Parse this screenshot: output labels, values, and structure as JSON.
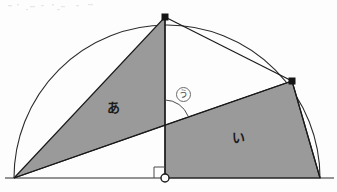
{
  "figure": {
    "background_color": "#fdfdfd",
    "line_color": "#1a1a1a",
    "arc_color": "#2b2b2b",
    "shade_color": "#9a9a9a",
    "base_line_color": "#2b2b2b",
    "labels": {
      "region_a": "あ",
      "region_b": "い",
      "angle_u": "う"
    },
    "points": {
      "base_left": {
        "name": "base-left-vertex",
        "x": 14,
        "y": 178,
        "marker": "none"
      },
      "base_center": {
        "name": "base-center-point",
        "x": 165,
        "y": 178,
        "marker": "open-circle"
      },
      "base_right": {
        "name": "base-right-vertex",
        "x": 320,
        "y": 178,
        "marker": "none"
      },
      "apex": {
        "name": "apex-vertex",
        "x": 165,
        "y": 17,
        "marker": "filled-square"
      },
      "arc_right": {
        "name": "arc-right-vertex",
        "x": 292,
        "y": 81,
        "marker": "filled-square"
      },
      "chord_cross": {
        "name": "chord-crossing-point",
        "x": 165,
        "y": 125,
        "marker": "none"
      }
    },
    "semicircle": {
      "center_x": 167,
      "center_y": 178,
      "radius": 153,
      "start_angle_deg": 180,
      "end_angle_deg": 0
    },
    "right_angle_mark": {
      "name": "right-angle-square",
      "x": 155,
      "y": 167,
      "size": 11
    },
    "angle_arc": {
      "name": "angle-u-arc",
      "center_x": 165,
      "center_y": 125,
      "radius": 25,
      "from": "vertical-up",
      "to": "chord-to-arc-right"
    },
    "region_a_polygon": [
      [
        14,
        178
      ],
      [
        165,
        17
      ],
      [
        165,
        125
      ]
    ],
    "region_b_polygon": [
      [
        165,
        125
      ],
      [
        292,
        81
      ],
      [
        320,
        178
      ],
      [
        165,
        178
      ]
    ],
    "colors": {
      "shade": "#9a9a9a",
      "stroke": "#1a1a1a",
      "paper": "#fdfdfd",
      "ring": "#6b6b6b"
    }
  }
}
